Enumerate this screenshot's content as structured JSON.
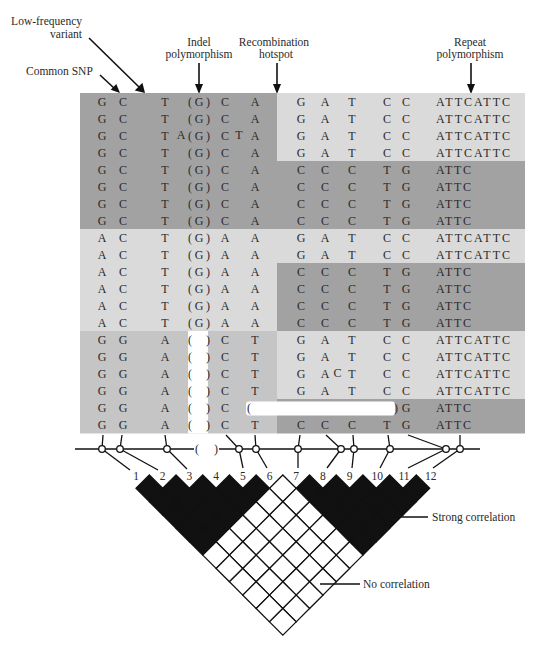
{
  "annotations": {
    "low_frequency_variant": {
      "line1": "Low-frequency",
      "line2": "variant"
    },
    "common_snp": {
      "line1": "Common SNP"
    },
    "indel_polymorphism": {
      "line1": "Indel",
      "line2": "polymorphism"
    },
    "recombination_hotspot": {
      "line1": "Recombination",
      "line2": "hotspot"
    },
    "repeat_polymorphism": {
      "line1": "Repeat",
      "line2": "polymorphism"
    }
  },
  "colors": {
    "dark_band": "#a2a2a2",
    "light_band": "#dadada",
    "medium_band": "#c5c5c5",
    "deletion_fill": "#ffffff",
    "strong_ld": "#111111",
    "no_ld": "#ffffff"
  },
  "haplotypes": [
    {
      "left_band": "dark",
      "right_band": "light",
      "bases": [
        "G",
        "C",
        "T",
        "(G)",
        "C",
        "A",
        "G",
        "A",
        "T",
        "C",
        "C",
        "ATTCATTC"
      ]
    },
    {
      "left_band": "dark",
      "right_band": "light",
      "bases": [
        "G",
        "C",
        "T",
        "(G)",
        "C",
        "A",
        "G",
        "A",
        "T",
        "C",
        "C",
        "ATTCATTC"
      ]
    },
    {
      "left_band": "dark",
      "right_band": "light",
      "bases": [
        "G",
        "C",
        "T",
        "(G)",
        "C",
        "A",
        "G",
        "A",
        "T",
        "C",
        "C",
        "ATTCATTC"
      ],
      "insertions": [
        {
          "after_col": 2,
          "base": "A"
        },
        {
          "after_col": 4,
          "base": "T"
        }
      ]
    },
    {
      "left_band": "dark",
      "right_band": "light",
      "bases": [
        "G",
        "C",
        "T",
        "(G)",
        "C",
        "A",
        "G",
        "A",
        "T",
        "C",
        "C",
        "ATTCATTC"
      ]
    },
    {
      "left_band": "dark",
      "right_band": "dark",
      "bases": [
        "G",
        "C",
        "T",
        "(G)",
        "C",
        "A",
        "C",
        "C",
        "C",
        "T",
        "G",
        "ATTC"
      ]
    },
    {
      "left_band": "dark",
      "right_band": "dark",
      "bases": [
        "G",
        "C",
        "T",
        "(G)",
        "C",
        "A",
        "C",
        "C",
        "C",
        "T",
        "G",
        "ATTC"
      ]
    },
    {
      "left_band": "dark",
      "right_band": "dark",
      "bases": [
        "G",
        "C",
        "T",
        "(G)",
        "C",
        "A",
        "C",
        "C",
        "C",
        "T",
        "G",
        "ATTC"
      ]
    },
    {
      "left_band": "dark",
      "right_band": "dark",
      "bases": [
        "G",
        "C",
        "T",
        "(G)",
        "C",
        "A",
        "C",
        "C",
        "C",
        "T",
        "G",
        "ATTC"
      ]
    },
    {
      "left_band": "light",
      "right_band": "light",
      "bases": [
        "A",
        "C",
        "T",
        "(G)",
        "A",
        "A",
        "G",
        "A",
        "T",
        "C",
        "C",
        "ATTCATTC"
      ]
    },
    {
      "left_band": "light",
      "right_band": "light",
      "bases": [
        "A",
        "C",
        "T",
        "(G)",
        "A",
        "A",
        "G",
        "A",
        "T",
        "C",
        "C",
        "ATTCATTC"
      ]
    },
    {
      "left_band": "light",
      "right_band": "dark",
      "bases": [
        "A",
        "C",
        "T",
        "(G)",
        "A",
        "A",
        "C",
        "C",
        "C",
        "T",
        "G",
        "ATTC"
      ]
    },
    {
      "left_band": "light",
      "right_band": "dark",
      "bases": [
        "A",
        "C",
        "T",
        "(G)",
        "A",
        "A",
        "C",
        "C",
        "C",
        "T",
        "G",
        "ATTC"
      ]
    },
    {
      "left_band": "light",
      "right_band": "dark",
      "bases": [
        "A",
        "C",
        "T",
        "(G)",
        "A",
        "A",
        "C",
        "C",
        "C",
        "T",
        "G",
        "ATTC"
      ]
    },
    {
      "left_band": "light",
      "right_band": "dark",
      "bases": [
        "A",
        "C",
        "T",
        "(G)",
        "A",
        "A",
        "C",
        "C",
        "C",
        "T",
        "G",
        "ATTC"
      ]
    },
    {
      "left_band": "medium",
      "right_band": "light",
      "bases": [
        "G",
        "G",
        "A",
        "( )",
        "C",
        "T",
        "G",
        "A",
        "T",
        "C",
        "C",
        "ATTCATTC"
      ]
    },
    {
      "left_band": "medium",
      "right_band": "light",
      "bases": [
        "G",
        "G",
        "A",
        "( )",
        "C",
        "T",
        "G",
        "A",
        "T",
        "C",
        "C",
        "ATTCATTC"
      ]
    },
    {
      "left_band": "medium",
      "right_band": "light",
      "bases": [
        "G",
        "G",
        "A",
        "( )",
        "C",
        "T",
        "G",
        "A",
        "T",
        "C",
        "C",
        "ATTCATTC"
      ],
      "insertions": [
        {
          "after_col": 7,
          "base": "C"
        }
      ]
    },
    {
      "left_band": "medium",
      "right_band": "light",
      "bases": [
        "G",
        "G",
        "A",
        "( )",
        "C",
        "T",
        "G",
        "A",
        "T",
        "C",
        "C",
        "ATTCATTC"
      ]
    },
    {
      "left_band": "medium",
      "right_band": "dark",
      "bases": [
        "G",
        "G",
        "A",
        "( )",
        "C",
        "(",
        "",
        "",
        "",
        ")",
        "G",
        "ATTC"
      ],
      "deletion": {
        "from_col": 5,
        "to_col": 9
      }
    },
    {
      "left_band": "medium",
      "right_band": "dark",
      "bases": [
        "G",
        "G",
        "A",
        "( )",
        "C",
        "T",
        "C",
        "C",
        "C",
        "T",
        "G",
        "ATTC"
      ]
    }
  ],
  "marker_track": {
    "indel_open": "(",
    "indel_close": ")",
    "labels": [
      "1",
      "2",
      "3",
      "4",
      "5",
      "6",
      "7",
      "8",
      "9",
      "10",
      "11",
      "12"
    ]
  },
  "ld_plot": {
    "marker_count": 12,
    "strong_blocks": [
      [
        1,
        6
      ],
      [
        7,
        12
      ]
    ],
    "legend": {
      "strong": "Strong correlation",
      "none": "No correlation"
    }
  }
}
